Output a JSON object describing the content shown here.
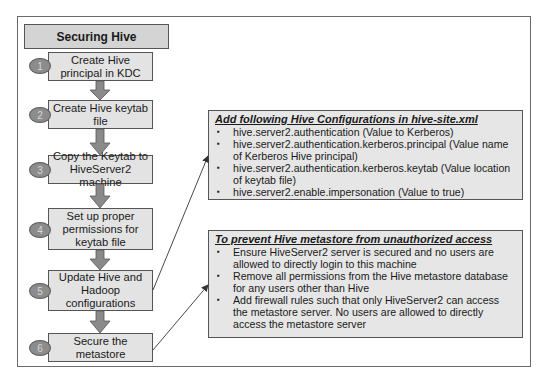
{
  "diagram": {
    "title": "Securing Hive",
    "steps": [
      {
        "number": "1",
        "label": "Create Hive principal in KDC"
      },
      {
        "number": "2",
        "label": "Create Hive keytab file"
      },
      {
        "number": "3",
        "label": "Copy the Keytab to HiveServer2 machine"
      },
      {
        "number": "4",
        "label": "Set up proper permissions for keytab file"
      },
      {
        "number": "5",
        "label": "Update Hive and Hadoop configurations"
      },
      {
        "number": "6",
        "label": "Secure the metastore"
      }
    ],
    "config_panel": {
      "title": "Add following Hive Configurations in hive-site.xml",
      "items": [
        "hive.server2.authentication (Value to Kerberos)",
        "hive.server2.authentication.kerberos.principal (Value name of Kerberos Hive principal)",
        "hive.server2.authentication.kerberos.keytab (Value location of keytab file)",
        "hive.server2.enable.impersonation (Value to true)"
      ]
    },
    "metastore_panel": {
      "title": "To prevent Hive metastore from unauthorized access",
      "items": [
        "Ensure HiveServer2 server is secured and no users are allowed to directly login to this machine",
        "Remove all permissions from the Hive metastore database for any users other than Hive",
        "Add firewall rules such that only HiveServer2 can access the metastore server. No users are allowed to directly access the metastore server"
      ]
    },
    "colors": {
      "title_fill": "#d4d4d4",
      "step_fill": "#e3e3e3",
      "badge_fill": "#8c8c8c",
      "arrow_fill": "#8a8a8a",
      "panel_fill": "#e6e6e6",
      "border": "#555555"
    }
  }
}
